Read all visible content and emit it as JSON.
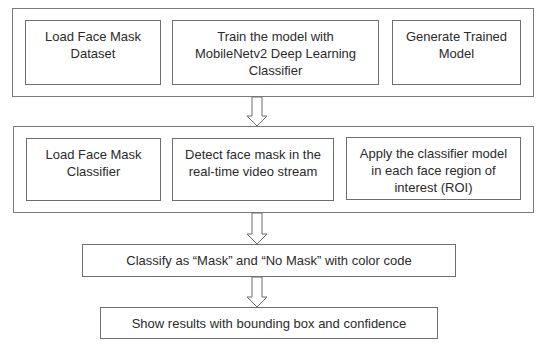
{
  "diagram": {
    "type": "flowchart",
    "stage1": {
      "steps": [
        {
          "label": "Load Face Mask Dataset"
        },
        {
          "label": "Train the model with MobileNetv2 Deep Learning Classifier"
        },
        {
          "label": "Generate Trained Model"
        }
      ]
    },
    "stage2": {
      "steps": [
        {
          "label": "Load Face Mask Classifier"
        },
        {
          "label": "Detect face mask in the real-time video stream"
        },
        {
          "label": "Apply the classifier model in each face region of interest (ROI)"
        }
      ]
    },
    "stage3": {
      "label": "Classify as “Mask” and “No Mask” with color code"
    },
    "stage4": {
      "label": "Show results with bounding box and confidence"
    },
    "arrows": [
      {
        "from": "stage1",
        "to": "stage2"
      },
      {
        "from": "stage2",
        "to": "stage3"
      },
      {
        "from": "stage3",
        "to": "stage4"
      }
    ],
    "colors": {
      "border": "#6e6e6e",
      "text": "#2b2b2b",
      "background": "#ffffff"
    }
  }
}
